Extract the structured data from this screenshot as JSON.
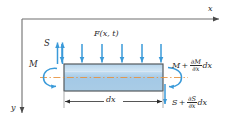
{
  "figure": {
    "type": "engineering-free-body-diagram"
  },
  "axes": {
    "x_label": "x",
    "y_label": "y",
    "origin_x": 22,
    "origin_y": 19,
    "x_arrow_end": 226,
    "y_arrow_end": 120
  },
  "labels": {
    "load": "F(x, t)",
    "shear_left": "S",
    "moment_left": "M",
    "moment_right_base": "M",
    "moment_right_plus": "+",
    "moment_right_num": "∂M",
    "moment_right_den": "∂x",
    "moment_right_tail": "dx",
    "shear_right_base": "S",
    "shear_right_plus": "+",
    "shear_right_num": "∂S",
    "shear_right_den": "∂x",
    "shear_right_tail": "dx",
    "dimension": "dx"
  },
  "beam": {
    "left": 64,
    "right": 163,
    "top": 64,
    "bottom": 91,
    "fill": "#a9cce6",
    "fill_light": "#c9e0f2",
    "border": "#555a5e",
    "centerline_color": "#e8903a"
  },
  "arrows": {
    "load_color": "#3a9ad9",
    "load_count": 6,
    "load_x_positions": [
      62,
      82,
      102,
      122,
      142,
      162
    ],
    "load_top_y": 44,
    "load_bottom_y": 64,
    "shear_left_color": "#3a9ad9",
    "shear_left_x": [
      58,
      62
    ],
    "shear_right_x": 165,
    "moment_arc_color": "#3a9ad9"
  },
  "colors": {
    "axis": "#6f6f6f",
    "text": "#2b2b2b",
    "accent_blue": "#3a9ad9",
    "beam_fill": "#a9cce6",
    "beam_border": "#555a5e",
    "centerline_orange": "#e8903a"
  }
}
